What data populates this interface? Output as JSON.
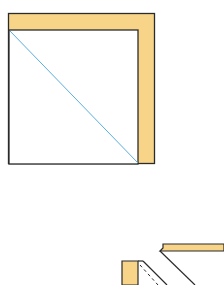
{
  "diagram": {
    "type": "geometric-construction",
    "colors": {
      "stroke": "#2b2b2b",
      "fill_band": "#f7d488",
      "diagonal": "#5aaee0",
      "background": "#ffffff"
    },
    "top_figure": {
      "description": "square with L-shaped shaded band on top and right, diagonal from inner top-left to bottom-right",
      "outer_square": {
        "x": 8,
        "y": 13,
        "w": 147,
        "h": 151
      },
      "inner_square": {
        "x": 9,
        "y": 30,
        "w": 129,
        "h": 134
      },
      "diagonal": {
        "x1": 10,
        "y1": 31,
        "x2": 138,
        "y2": 163
      }
    },
    "bottom_figure": {
      "description": "partially visible 3D folded/sliced shape, cropped at bottom-right"
    }
  }
}
